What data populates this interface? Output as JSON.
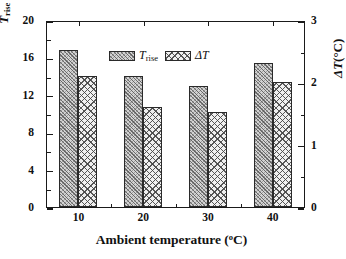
{
  "chart_data": {
    "type": "bar",
    "title": "",
    "xlabel": "Ambient temperature (°C)",
    "ylabel": "T_rise (°C)",
    "ylabel_right": "ΔT (°C)",
    "categories": [
      "10",
      "20",
      "30",
      "40"
    ],
    "series": [
      {
        "name": "T_rise",
        "axis": "left",
        "values": [
          16.8,
          14.0,
          12.9,
          15.4
        ],
        "pattern": "diagonal-dense-hatch",
        "color": "#d3d3d3"
      },
      {
        "name": "ΔT",
        "axis": "right",
        "values": [
          2.1,
          1.6,
          1.52,
          2.0
        ],
        "pattern": "cross-hatch",
        "color": "#f0f0f0"
      }
    ],
    "ylim": [
      0,
      20
    ],
    "ylim_right": [
      0,
      3
    ],
    "yticks": [
      0,
      4,
      8,
      12,
      16,
      20
    ],
    "yticks_right": [
      0,
      1,
      2,
      3
    ],
    "grid": false,
    "legend_position": "top-left-inside"
  },
  "axes": {
    "left": {
      "title_main": "T",
      "title_sub": "rise",
      "title_unit": "(°C)",
      "ticks": [
        "0",
        "4",
        "8",
        "12",
        "16",
        "20"
      ]
    },
    "right": {
      "title_main": "ΔT",
      "title_unit": "(°C)",
      "ticks": [
        "0",
        "1",
        "2",
        "3"
      ]
    },
    "bottom": {
      "title_main": "Ambient temperature",
      "title_unit": "(°C)",
      "ticks": [
        "10",
        "20",
        "30",
        "40"
      ]
    }
  },
  "legend": {
    "entries": [
      {
        "label_main": "T",
        "label_sub": "rise",
        "swatch": "diagonal-dense-hatch"
      },
      {
        "label_main": "ΔT",
        "label_sub": "",
        "swatch": "cross-hatch"
      }
    ]
  },
  "colors": {
    "axis": "#1a1a1a",
    "bar_trise": "#d3d3d3",
    "bar_deltat": "#f0f0f0",
    "bar_edge": "#2a2a2a",
    "background": "#ffffff"
  }
}
